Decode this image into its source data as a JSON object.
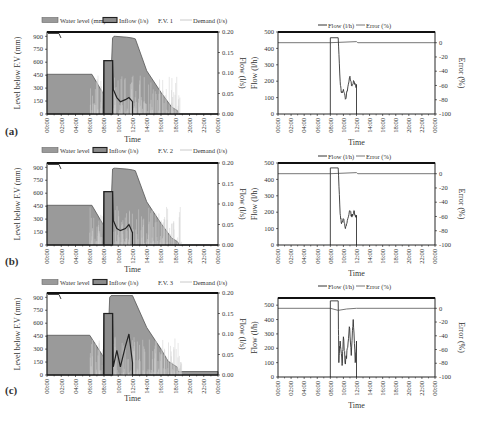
{
  "chart_data": [
    {
      "panel": "(a)",
      "type": "area",
      "title": "",
      "legend": [
        "Water level (mm)",
        "Inflow (l/s)",
        "F.V. 1",
        "Demand (l/s)"
      ],
      "xlabel": "Time",
      "ylabel": "Level below F.V (mm)",
      "y2label": "Flow (l/s)",
      "x_ticks": [
        "00:00",
        "02:00",
        "04:00",
        "06:00",
        "08:00",
        "10:00",
        "12:00",
        "14:00",
        "16:00",
        "18:00",
        "20:00",
        "22:00",
        "00:00"
      ],
      "y_ticks": [
        0,
        150,
        300,
        450,
        600,
        750,
        900
      ],
      "y2_ticks": [
        "0.00",
        "0.05",
        "0.10",
        "0.15",
        "0.20"
      ],
      "ylim": [
        0,
        950
      ],
      "y2lim": [
        0,
        0.2
      ],
      "series": [
        {
          "name": "Water level (mm)",
          "x_hours": [
            0,
            6.3,
            8.5,
            8.8,
            9.2,
            9.4,
            9.6,
            11.2,
            12.0,
            12.4,
            14.0,
            16.0,
            17.5,
            18.3,
            18.6,
            24
          ],
          "values": [
            460,
            460,
            150,
            60,
            880,
            900,
            900,
            890,
            880,
            870,
            500,
            250,
            80,
            40,
            0,
            0
          ]
        },
        {
          "name": "Inflow (l/s)",
          "x_hours": [
            0,
            7.9,
            8.0,
            9.2,
            9.3,
            9.8,
            10.3,
            11.0,
            11.5,
            12.0,
            12.0,
            24
          ],
          "values": [
            0,
            0,
            0.13,
            0.13,
            0.06,
            0.04,
            0.03,
            0.035,
            0.04,
            0.03,
            0,
            0
          ]
        },
        {
          "name": "F.V. 1",
          "x_hours": [
            0,
            1.5
          ],
          "values": [
            0.2,
            0.19
          ]
        },
        {
          "name": "Demand (l/s)",
          "note": "high-frequency spikes 06:00-19:00 up to ~0.1 l/s"
        }
      ]
    },
    {
      "panel": "(a)",
      "type": "line",
      "legend": [
        "Flow (l/h)",
        "Error (%)"
      ],
      "xlabel": "Time",
      "ylabel": "Flow (l/h)",
      "y2label": "Error (%)",
      "x_ticks": [
        "00:00",
        "02:00",
        "04:00",
        "06:00",
        "08:00",
        "10:00",
        "12:00",
        "14:00",
        "16:00",
        "18:00",
        "20:00",
        "22:00",
        "00:00"
      ],
      "y_ticks": [
        0,
        100,
        200,
        300,
        400,
        500
      ],
      "y2_ticks": [
        0,
        -20,
        -40,
        -60,
        -80,
        -100
      ],
      "ylim": [
        0,
        500
      ],
      "y2lim": [
        -100,
        15
      ],
      "series": [
        {
          "name": "Flow (l/h)",
          "x_hours": [
            8.0,
            8.0,
            9.2,
            9.5,
            9.7,
            10.0,
            10.3,
            10.6,
            11.0,
            11.3,
            11.6,
            11.9,
            12.0,
            12.0
          ],
          "values": [
            0,
            465,
            465,
            200,
            130,
            150,
            90,
            140,
            230,
            170,
            200,
            170,
            180,
            0
          ]
        },
        {
          "name": "Error (%)",
          "x_hours": [
            0,
            8.0,
            12.0,
            12.2,
            24
          ],
          "values": [
            0,
            0,
            1.5,
            0,
            0
          ]
        }
      ]
    },
    {
      "panel": "(b)",
      "type": "area",
      "legend": [
        "Water level",
        "Inflow (l/s)",
        "F.V. 2",
        "Demand (l/s)"
      ],
      "xlabel": "Time",
      "ylabel": "Level below F.V (mm)",
      "y2label": "Flow (l/s)",
      "x_ticks": [
        "00:00",
        "02:00",
        "04:00",
        "06:00",
        "08:00",
        "10:00",
        "12:00",
        "14:00",
        "16:00",
        "18:00",
        "20:00",
        "22:00",
        "00:00"
      ],
      "y_ticks": [
        0,
        150,
        300,
        450,
        600,
        750,
        900
      ],
      "y2_ticks": [
        "0.00",
        "0.05",
        "0.10",
        "0.15",
        "0.20"
      ],
      "ylim": [
        0,
        950
      ],
      "y2lim": [
        0,
        0.2
      ],
      "series": [
        {
          "name": "Water level",
          "x_hours": [
            0,
            6.3,
            8.5,
            8.8,
            9.2,
            9.4,
            9.6,
            11.2,
            12.0,
            12.4,
            14.0,
            16.0,
            17.5,
            18.3,
            18.6,
            24
          ],
          "values": [
            460,
            460,
            150,
            60,
            880,
            890,
            890,
            880,
            870,
            860,
            500,
            250,
            80,
            40,
            0,
            0
          ]
        },
        {
          "name": "Inflow (l/s)",
          "x_hours": [
            0,
            7.9,
            8.0,
            9.2,
            9.3,
            9.8,
            10.3,
            11.0,
            11.5,
            12.0,
            12.0,
            24
          ],
          "values": [
            0,
            0,
            0.13,
            0.13,
            0.06,
            0.04,
            0.035,
            0.04,
            0.05,
            0.03,
            0,
            0
          ]
        },
        {
          "name": "F.V. 2",
          "x_hours": [
            0,
            1.5
          ],
          "values": [
            0.2,
            0.19
          ]
        },
        {
          "name": "Demand (l/s)",
          "note": "high-frequency spikes 06:00-19:00"
        }
      ]
    },
    {
      "panel": "(b)",
      "type": "line",
      "legend": [
        "Flow (l/h)",
        "Error (%)"
      ],
      "xlabel": "Time",
      "ylabel": "Flow (l/h)",
      "y2label": "Error (%)",
      "x_ticks": [
        "00:00",
        "02:00",
        "04:00",
        "06:00",
        "08:00",
        "10:00",
        "12:00",
        "14:00",
        "16:00",
        "18:00",
        "20:00",
        "22:00",
        "00:00"
      ],
      "y_ticks": [
        0,
        100,
        200,
        300,
        400,
        500
      ],
      "y2_ticks": [
        0,
        -20,
        -40,
        -60,
        -80,
        -100
      ],
      "ylim": [
        0,
        500
      ],
      "y2lim": [
        -100,
        15
      ],
      "series": [
        {
          "name": "Flow (l/h)",
          "x_hours": [
            8.0,
            8.0,
            9.2,
            9.5,
            9.7,
            10.0,
            10.3,
            10.6,
            11.0,
            11.3,
            11.6,
            11.9,
            12.0,
            12.0
          ],
          "values": [
            0,
            470,
            470,
            190,
            130,
            160,
            100,
            150,
            210,
            170,
            210,
            170,
            180,
            0
          ]
        },
        {
          "name": "Error (%)",
          "x_hours": [
            0,
            8.0,
            12.0,
            12.2,
            24
          ],
          "values": [
            0,
            0,
            1.5,
            0,
            0
          ]
        }
      ]
    },
    {
      "panel": "(c)",
      "type": "area",
      "legend": [
        "Water level",
        "Inflow (l/s)",
        "F.V. 3",
        "Demand (l/s)"
      ],
      "xlabel": "Time",
      "ylabel": "Level below F.V (mm)",
      "y2label": "Flow (l/s)",
      "x_ticks": [
        "00:00",
        "02:00",
        "04:00",
        "06:00",
        "08:00",
        "10:00",
        "12:00",
        "14:00",
        "16:00",
        "18:00",
        "20:00",
        "22:00",
        "00:00"
      ],
      "y_ticks": [
        0,
        150,
        300,
        450,
        600,
        750,
        900
      ],
      "y2_ticks": [
        "0.00",
        "0.05",
        "0.10",
        "0.15",
        "0.20"
      ],
      "ylim": [
        0,
        950
      ],
      "y2lim": [
        0,
        0.2
      ],
      "series": [
        {
          "name": "Water level",
          "x_hours": [
            0,
            6.0,
            8.0,
            8.4,
            8.8,
            9.0,
            12.0,
            14.0,
            16.0,
            17.0,
            18.3,
            18.4,
            24
          ],
          "values": [
            460,
            460,
            200,
            50,
            900,
            920,
            920,
            550,
            300,
            160,
            90,
            40,
            40
          ]
        },
        {
          "name": "Inflow (l/s)",
          "x_hours": [
            0,
            7.9,
            8.0,
            9.2,
            9.3,
            9.8,
            10.3,
            11.0,
            11.5,
            12.0,
            12.0,
            24
          ],
          "values": [
            0,
            0,
            0.15,
            0.15,
            0.02,
            0.06,
            0.02,
            0.07,
            0.1,
            0.03,
            0,
            0
          ]
        },
        {
          "name": "F.V. 3",
          "x_hours": [
            0,
            1.5
          ],
          "values": [
            0.2,
            0.19
          ]
        },
        {
          "name": "Demand (l/s)",
          "note": "high-frequency spikes 06:00-19:00"
        }
      ]
    },
    {
      "panel": "(c)",
      "type": "line",
      "legend": [
        "Flow (l/h)",
        "Error (%)"
      ],
      "xlabel": "Time",
      "ylabel": "Flow (l/h)",
      "y2label": "Error (%)",
      "x_ticks": [
        "00:00",
        "02:00",
        "04:00",
        "06:00",
        "08:00",
        "10:00",
        "12:00",
        "14:00",
        "16:00",
        "18:00",
        "20:00",
        "22:00",
        "00:00"
      ],
      "y_ticks": [
        0,
        100,
        200,
        300,
        400,
        500
      ],
      "y2_ticks": [
        0,
        -20,
        -40,
        -60,
        -80,
        -100
      ],
      "ylim": [
        0,
        550
      ],
      "y2lim": [
        -100,
        15
      ],
      "series": [
        {
          "name": "Flow (l/h)",
          "x_hours": [
            8.0,
            8.0,
            9.2,
            9.3,
            9.5,
            9.8,
            10.0,
            10.3,
            10.6,
            10.9,
            11.2,
            11.5,
            11.8,
            12.0,
            12.0
          ],
          "values": [
            0,
            530,
            530,
            100,
            250,
            80,
            280,
            90,
            200,
            350,
            150,
            400,
            100,
            250,
            0
          ]
        },
        {
          "name": "Error (%)",
          "x_hours": [
            0,
            8.0,
            9.2,
            10.5,
            12.0,
            24
          ],
          "values": [
            0,
            0,
            -3,
            -1,
            0,
            0
          ]
        }
      ]
    }
  ],
  "panels": {
    "a": {
      "label": "(a)",
      "fv": "F.V. 1",
      "wl_legend": "Water level (mm)"
    },
    "b": {
      "label": "(b)",
      "fv": "F.V. 2",
      "wl_legend": "Water level"
    },
    "c": {
      "label": "(c)",
      "fv": "F.V. 3",
      "wl_legend": "Water level"
    }
  },
  "legend": {
    "inflow": "Inflow (l/s)",
    "demand": "Demand (l/s)",
    "flow": "Flow (l/h)",
    "error": "Error (%)"
  },
  "axes": {
    "time": "Time",
    "level": "Level below F.V (mm)",
    "flow_ls": "Flow (l/s)",
    "flow_lh": "Flow (l/h)",
    "error": "Error (%)"
  },
  "colors": {
    "water_level_fill": "#9a9a9a",
    "water_level_edge": "#555555",
    "inflow": "#222222",
    "demand": "#bdbdbd",
    "flow": "#333333",
    "error": "#777777",
    "axis": "#111111"
  }
}
